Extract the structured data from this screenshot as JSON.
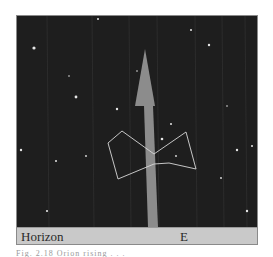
{
  "figure": {
    "horizon_label": "Horizon",
    "direction_label": "E",
    "sky_color": "#1e1e1e",
    "horizon_color": "#c9c9c9",
    "arrow_color": "#8c8c8c",
    "constellation_line_color": "#d8d8d8",
    "star_color": "#e6e6e6",
    "arrow": {
      "tip": [
        128,
        33
      ],
      "head_base_y": 90,
      "head_half_width": 10,
      "shaft_top": [
        127,
        136
      ],
      "shaft_bottom": [
        131,
        141
      ]
    },
    "constellation": {
      "name": "orion-asterism",
      "lines": [
        [
          [
            105,
            115
          ],
          [
            91,
            127
          ]
        ],
        [
          [
            91,
            127
          ],
          [
            101,
            163
          ]
        ],
        [
          [
            101,
            163
          ],
          [
            137,
            148
          ]
        ],
        [
          [
            137,
            148
          ],
          [
            152,
            147
          ]
        ],
        [
          [
            152,
            147
          ],
          [
            179,
            153
          ]
        ],
        [
          [
            179,
            153
          ],
          [
            169,
            116
          ]
        ],
        [
          [
            169,
            116
          ],
          [
            137,
            138
          ]
        ],
        [
          [
            137,
            138
          ],
          [
            105,
            115
          ]
        ]
      ]
    },
    "stars": [
      [
        17,
        32,
        1.6
      ],
      [
        59,
        81,
        1.4
      ],
      [
        100,
        93,
        1.2
      ],
      [
        81,
        3,
        1.0
      ],
      [
        174,
        14,
        1.0
      ],
      [
        192,
        29,
        1.2
      ],
      [
        154,
        108,
        1.0
      ],
      [
        4,
        134,
        1.2
      ],
      [
        39,
        145,
        1.0
      ],
      [
        30,
        195,
        1.1
      ],
      [
        69,
        140,
        0.9
      ],
      [
        220,
        134,
        1.2
      ],
      [
        235,
        130,
        1.0
      ],
      [
        159,
        140,
        0.9
      ],
      [
        230,
        195,
        1.2
      ],
      [
        204,
        162,
        0.9
      ],
      [
        52,
        60,
        0.8
      ],
      [
        120,
        55,
        0.8
      ],
      [
        210,
        90,
        0.8
      ],
      [
        145,
        123,
        1.3
      ]
    ],
    "streaks_x": [
      30,
      75,
      112,
      140,
      178,
      205,
      228
    ]
  },
  "caption": {
    "text": "Fig. 2.18  Orion rising . . ."
  }
}
